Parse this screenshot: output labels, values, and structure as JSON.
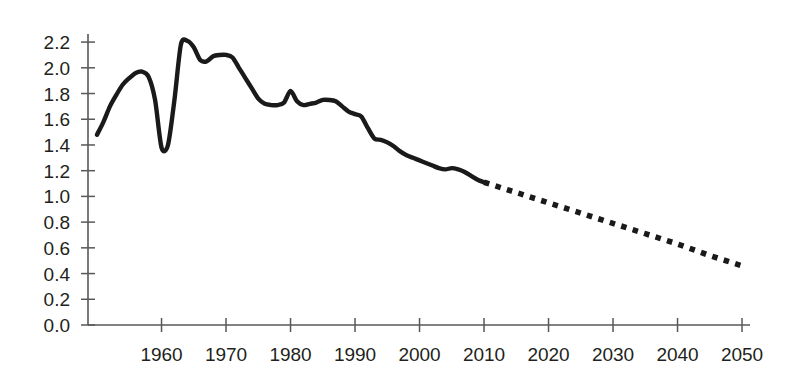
{
  "chart_data": {
    "type": "line",
    "title": "",
    "subtitle": "",
    "xlabel": "",
    "ylabel": "",
    "xlim": [
      1950,
      2050
    ],
    "ylim": [
      0.0,
      2.3
    ],
    "grid": false,
    "legend": "none",
    "y_ticks": [
      "0.0",
      "0.2",
      "0.4",
      "0.6",
      "0.8",
      "1.0",
      "1.2",
      "1.4",
      "1.6",
      "1.8",
      "2.0",
      "2.2"
    ],
    "y_tick_values": [
      0.0,
      0.2,
      0.4,
      0.6,
      0.8,
      1.0,
      1.2,
      1.4,
      1.6,
      1.8,
      2.0,
      2.2
    ],
    "x_ticks": [
      "1960",
      "1970",
      "1980",
      "1990",
      "2000",
      "2010",
      "2020",
      "2030",
      "2040",
      "2050"
    ],
    "x_tick_values": [
      1960,
      1970,
      1980,
      1990,
      2000,
      2010,
      2020,
      2030,
      2040,
      2050
    ],
    "series": [
      {
        "name": "historical",
        "style": "solid",
        "color": "#1a1a1a",
        "x": [
          1950,
          1951,
          1952,
          1953,
          1954,
          1955,
          1956,
          1957,
          1958,
          1959,
          1960,
          1961,
          1962,
          1963,
          1964,
          1965,
          1966,
          1967,
          1968,
          1969,
          1970,
          1971,
          1972,
          1973,
          1974,
          1975,
          1976,
          1977,
          1978,
          1979,
          1980,
          1981,
          1982,
          1983,
          1984,
          1985,
          1986,
          1987,
          1988,
          1989,
          1990,
          1991,
          1992,
          1993,
          1994,
          1995,
          1996,
          1997,
          1998,
          1999,
          2000,
          2001,
          2002,
          2003,
          2004,
          2005,
          2006,
          2007,
          2008,
          2009,
          2010
        ],
        "y": [
          1.48,
          1.58,
          1.7,
          1.79,
          1.87,
          1.92,
          1.96,
          1.97,
          1.93,
          1.75,
          1.38,
          1.4,
          1.75,
          2.18,
          2.21,
          2.16,
          2.06,
          2.05,
          2.09,
          2.1,
          2.1,
          2.08,
          2.0,
          1.92,
          1.84,
          1.76,
          1.72,
          1.71,
          1.71,
          1.73,
          1.82,
          1.74,
          1.71,
          1.72,
          1.73,
          1.75,
          1.75,
          1.74,
          1.7,
          1.66,
          1.64,
          1.62,
          1.53,
          1.45,
          1.44,
          1.42,
          1.39,
          1.35,
          1.32,
          1.3,
          1.28,
          1.26,
          1.24,
          1.22,
          1.21,
          1.22,
          1.21,
          1.19,
          1.16,
          1.13,
          1.11
        ]
      },
      {
        "name": "projection",
        "style": "dotted",
        "color": "#1a1a1a",
        "x": [
          2010,
          2015,
          2020,
          2025,
          2030,
          2035,
          2040,
          2045,
          2050
        ],
        "y": [
          1.11,
          1.03,
          0.95,
          0.87,
          0.79,
          0.71,
          0.63,
          0.54,
          0.46
        ]
      }
    ],
    "annotations": []
  },
  "geometry": {
    "x_origin_px": 88,
    "y_origin_px": 325,
    "px_per_year": 6.45,
    "year_at_origin": 1948.6,
    "px_per_unit": 128.6,
    "axis_right_px": 750
  }
}
